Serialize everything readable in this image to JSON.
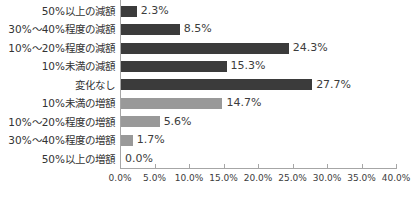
{
  "chart_data": {
    "type": "bar",
    "orientation": "horizontal",
    "title": "",
    "categories": [
      "50%以上の減額",
      "30%〜40%程度の減額",
      "10%〜20%程度の減額",
      "10%未満の減額",
      "変化なし",
      "10%未満の増額",
      "10%〜20%程度の増額",
      "30%〜40%程度の増額",
      "50%以上の増額"
    ],
    "values": [
      2.3,
      8.5,
      24.3,
      15.3,
      27.7,
      14.7,
      5.6,
      1.7,
      0.0
    ],
    "value_labels": [
      "2.3%",
      "8.5%",
      "24.3%",
      "15.3%",
      "27.7%",
      "14.7%",
      "5.6%",
      "1.7%",
      "0.0%"
    ],
    "bar_colors": [
      "#3b3b3b",
      "#3b3b3b",
      "#3b3b3b",
      "#3b3b3b",
      "#3b3b3b",
      "#999999",
      "#999999",
      "#999999",
      "#999999"
    ],
    "xlim": [
      0,
      40
    ],
    "x_tick_values": [
      0,
      5,
      10,
      15,
      20,
      25,
      30,
      35,
      40
    ],
    "x_tick_labels": [
      "0.0%",
      "5.0%",
      "10.0%",
      "15.0%",
      "20.0%",
      "25.0%",
      "30.0%",
      "35.0%",
      "40.0%"
    ],
    "xlabel": "",
    "ylabel": "",
    "grid": "off",
    "legend": "none",
    "data_labels": "outside-end"
  },
  "colors": {
    "dark_bar": "#3b3b3b",
    "light_bar": "#999999",
    "axis": "#a6a6a6",
    "label_text": "#333333",
    "value_text": "#3c3c3c",
    "background": "#ffffff"
  }
}
